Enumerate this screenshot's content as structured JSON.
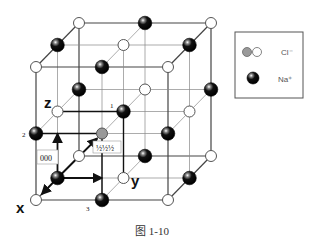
{
  "figure": {
    "caption": "图 1-10",
    "axes": {
      "x": "x",
      "y": "y",
      "z": "z"
    },
    "labels": {
      "origin": "000",
      "center": "½½½",
      "n1": "1",
      "n2": "2",
      "n3": "3"
    },
    "legend": {
      "items": [
        {
          "name": "chloride",
          "label": "Cl⁻",
          "symbol": "gray-and-white-circle"
        },
        {
          "name": "sodium",
          "label": "Na⁺",
          "symbol": "black-sphere"
        }
      ]
    },
    "colors": {
      "na": "#111111",
      "cl": "#ffffff",
      "highlight": "#9a9a9a",
      "line": "#555555"
    }
  }
}
